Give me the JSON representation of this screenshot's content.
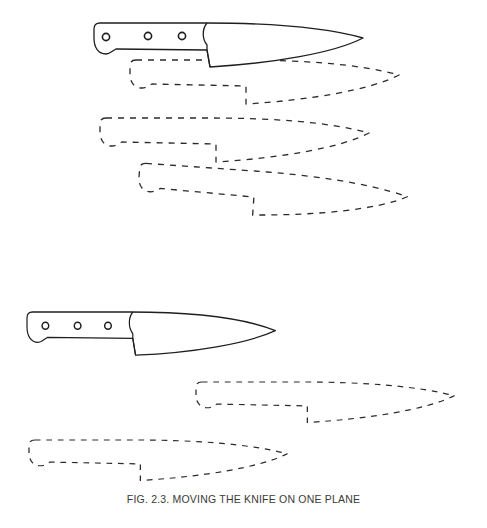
{
  "figure": {
    "caption": "FIG. 2.3. MOVING THE KNIFE ON ONE PLANE",
    "groups": [
      {
        "name": "upper-sequence",
        "solid_knife": {
          "x": 94,
          "y": 23
        },
        "dashed_positions": [
          {
            "x": 130,
            "y": 60,
            "rotate": 0
          },
          {
            "x": 100,
            "y": 118,
            "rotate": 0
          },
          {
            "x": 140,
            "y": 163,
            "rotate": 4
          }
        ]
      },
      {
        "name": "lower-sequence",
        "solid_knife": {
          "x": 27,
          "y": 312
        },
        "dashed_positions": [
          {
            "x": 196,
            "y": 382,
            "rotate": 0
          },
          {
            "x": 29,
            "y": 440,
            "rotate": 0
          }
        ]
      }
    ]
  }
}
